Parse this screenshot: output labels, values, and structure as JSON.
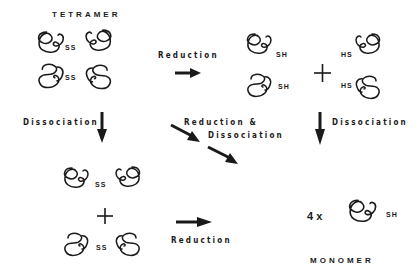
{
  "diagram": {
    "labels": {
      "tetramer": "TETRAMER",
      "monomer": "MONOMER",
      "reduction_top": "Reduction",
      "reduction_bottom": "Reduction",
      "dissociation_left": "Dissociation",
      "dissociation_right": "Dissociation",
      "reduction_and": "Reduction &",
      "dissociation_diag": "Dissociation",
      "count": "4 x"
    },
    "bonds": {
      "ss": "SS",
      "sh": "SH",
      "hs": "HS"
    },
    "operators": {
      "plus": "+"
    },
    "nodes": [
      {
        "id": "tetramer",
        "label": "TETRAMER",
        "subunits": 4,
        "bond": "SS"
      },
      {
        "id": "reduced-dimers",
        "subunits": 4,
        "bonds": [
          "SH",
          "SH",
          "HS",
          "HS"
        ]
      },
      {
        "id": "dimers",
        "subunits": 2,
        "bond": "SS",
        "count": 2
      },
      {
        "id": "monomer",
        "label": "MONOMER",
        "multiplier": "4 x",
        "bond": "SH"
      }
    ],
    "edges": [
      {
        "from": "tetramer",
        "to": "reduced-dimers",
        "label": "Reduction"
      },
      {
        "from": "tetramer",
        "to": "dimers",
        "label": "Dissociation"
      },
      {
        "from": "tetramer",
        "to": "monomer",
        "label": "Reduction & Dissociation"
      },
      {
        "from": "reduced-dimers",
        "to": "monomer",
        "label": "Dissociation"
      },
      {
        "from": "dimers",
        "to": "monomer",
        "label": "Reduction"
      }
    ]
  }
}
